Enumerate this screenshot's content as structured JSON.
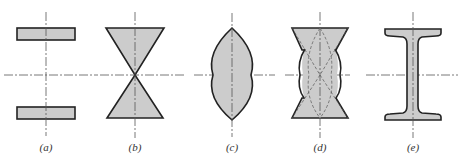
{
  "figure": {
    "fill_color": "#cccccc",
    "stroke_color": "#222222",
    "axis_color": "#444444",
    "panels": [
      {
        "id": "a",
        "label": "(a)",
        "shape": "two separated horizontal rectangles",
        "center_x": 46
      },
      {
        "id": "b",
        "label": "(b)",
        "shape": "two triangles meeting at apex (hourglass)",
        "center_x": 134
      },
      {
        "id": "c",
        "label": "(c)",
        "shape": "lens / pointed ellipse",
        "center_x": 232
      },
      {
        "id": "d",
        "label": "(d)",
        "shape": "hourglass combined with lens, dashed construction lines",
        "center_x": 319
      },
      {
        "id": "e",
        "label": "(e)",
        "shape": "I-beam section",
        "center_x": 413
      }
    ],
    "horizontal_axis_y": 75
  }
}
